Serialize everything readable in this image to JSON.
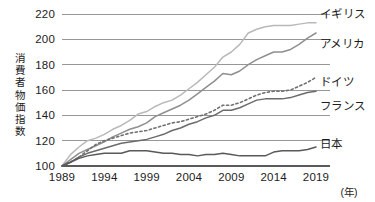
{
  "chart_data": {
    "type": "line",
    "title": "",
    "xlabel": "(年)",
    "ylabel": "消費者物価指数",
    "ylabel_chars": [
      "消",
      "費",
      "者",
      "物",
      "価",
      "指",
      "数"
    ],
    "xlim": [
      1989,
      2019
    ],
    "ylim": [
      100,
      220
    ],
    "grid": true,
    "gridlines_y": [
      100,
      120,
      140,
      160,
      180,
      200,
      220
    ],
    "legend_position": "right-inline",
    "yticks": [
      "220",
      "200",
      "180",
      "160",
      "140",
      "120",
      "100"
    ],
    "xticks": [
      "1989",
      "1994",
      "1999",
      "2004",
      "2009",
      "2014",
      "2019"
    ],
    "x": [
      1989,
      1990,
      1991,
      1992,
      1993,
      1994,
      1995,
      1996,
      1997,
      1998,
      1999,
      2000,
      2001,
      2002,
      2003,
      2004,
      2005,
      2006,
      2007,
      2008,
      2009,
      2010,
      2011,
      2012,
      2013,
      2014,
      2015,
      2016,
      2017,
      2018,
      2019
    ],
    "series": [
      {
        "name": "イギリス",
        "name_en": "United Kingdom",
        "color": "#b9b9b9",
        "style": "solid",
        "label_anchor_value": 213,
        "values": [
          100,
          109,
          115,
          120,
          122,
          125,
          129,
          132,
          136,
          141,
          143,
          147,
          150,
          152,
          156,
          161,
          166,
          172,
          178,
          186,
          190,
          196,
          205,
          208,
          210,
          211,
          211,
          211,
          212,
          213,
          213
        ]
      },
      {
        "name": "アメリカ",
        "name_en": "United States",
        "color": "#8f8f8f",
        "style": "solid",
        "label_anchor_value": 207,
        "values": [
          100,
          105,
          110,
          113,
          116,
          119,
          123,
          126,
          129,
          131,
          134,
          139,
          142,
          145,
          148,
          152,
          157,
          162,
          167,
          173,
          172,
          175,
          180,
          184,
          187,
          190,
          190,
          192,
          196,
          201,
          205
        ]
      },
      {
        "name": "ドイツ",
        "name_en": "Germany",
        "color": "#707070",
        "style": "dotted",
        "label_anchor_value": 172,
        "values": [
          100,
          103,
          107,
          112,
          117,
          120,
          122,
          124,
          126,
          127,
          128,
          130,
          132,
          134,
          135,
          137,
          139,
          141,
          144,
          148,
          148,
          150,
          153,
          156,
          158,
          159,
          159,
          160,
          163,
          166,
          170
        ]
      },
      {
        "name": "フランス",
        "name_en": "France",
        "color": "#6b6b6b",
        "style": "solid",
        "label_anchor_value": 159,
        "values": [
          100,
          103,
          107,
          110,
          112,
          114,
          116,
          118,
          119,
          120,
          121,
          123,
          125,
          128,
          130,
          133,
          135,
          138,
          140,
          144,
          144,
          146,
          149,
          152,
          153,
          153,
          153,
          154,
          156,
          158,
          159
        ]
      },
      {
        "name": "日本",
        "name_en": "Japan",
        "color": "#595959",
        "style": "solid",
        "label_anchor_value": 115,
        "values": [
          100,
          103,
          106,
          108,
          109,
          110,
          110,
          110,
          112,
          112,
          112,
          111,
          110,
          110,
          109,
          109,
          108,
          109,
          109,
          110,
          109,
          108,
          108,
          108,
          108,
          111,
          112,
          112,
          112,
          113,
          115
        ]
      }
    ]
  }
}
